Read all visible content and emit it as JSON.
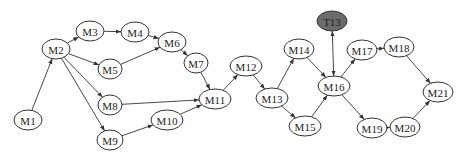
{
  "diagram": {
    "type": "directed-graph",
    "nodes": [
      {
        "id": "M1",
        "label": "M1",
        "x": 28,
        "y": 120,
        "rx": 14,
        "ry": 10,
        "style": "normal"
      },
      {
        "id": "M2",
        "label": "M2",
        "x": 56,
        "y": 49,
        "rx": 14,
        "ry": 10,
        "style": "normal"
      },
      {
        "id": "M3",
        "label": "M3",
        "x": 90,
        "y": 31,
        "rx": 14,
        "ry": 10,
        "style": "normal"
      },
      {
        "id": "M4",
        "label": "M4",
        "x": 135,
        "y": 32,
        "rx": 14,
        "ry": 10,
        "style": "normal"
      },
      {
        "id": "M5",
        "label": "M5",
        "x": 110,
        "y": 69,
        "rx": 12,
        "ry": 10,
        "style": "normal"
      },
      {
        "id": "M6",
        "label": "M6",
        "x": 172,
        "y": 42,
        "rx": 14,
        "ry": 10,
        "style": "normal"
      },
      {
        "id": "M7",
        "label": "M7",
        "x": 196,
        "y": 63,
        "rx": 12,
        "ry": 10,
        "style": "normal"
      },
      {
        "id": "M8",
        "label": "M8",
        "x": 110,
        "y": 105,
        "rx": 12,
        "ry": 10,
        "style": "normal"
      },
      {
        "id": "M9",
        "label": "M9",
        "x": 110,
        "y": 140,
        "rx": 13,
        "ry": 10,
        "style": "normal"
      },
      {
        "id": "M10",
        "label": "M10",
        "x": 167,
        "y": 120,
        "rx": 16,
        "ry": 10,
        "style": "normal"
      },
      {
        "id": "M11",
        "label": "M11",
        "x": 215,
        "y": 99,
        "rx": 16,
        "ry": 10,
        "style": "normal"
      },
      {
        "id": "M12",
        "label": "M12",
        "x": 246,
        "y": 66,
        "rx": 16,
        "ry": 10,
        "style": "normal"
      },
      {
        "id": "M13",
        "label": "M13",
        "x": 272,
        "y": 98,
        "rx": 16,
        "ry": 10,
        "style": "normal"
      },
      {
        "id": "M14",
        "label": "M14",
        "x": 299,
        "y": 49,
        "rx": 15,
        "ry": 10,
        "style": "normal"
      },
      {
        "id": "M15",
        "label": "M15",
        "x": 305,
        "y": 126,
        "rx": 16,
        "ry": 10,
        "style": "normal"
      },
      {
        "id": "M16",
        "label": "M16",
        "x": 334,
        "y": 86,
        "rx": 16,
        "ry": 10,
        "style": "normal"
      },
      {
        "id": "M17",
        "label": "M17",
        "x": 362,
        "y": 50,
        "rx": 15,
        "ry": 10,
        "style": "normal"
      },
      {
        "id": "M18",
        "label": "M18",
        "x": 399,
        "y": 47,
        "rx": 15,
        "ry": 10,
        "style": "normal"
      },
      {
        "id": "M19",
        "label": "M19",
        "x": 372,
        "y": 128,
        "rx": 15,
        "ry": 10,
        "style": "normal"
      },
      {
        "id": "M20",
        "label": "M20",
        "x": 405,
        "y": 127,
        "rx": 15,
        "ry": 10,
        "style": "normal"
      },
      {
        "id": "M21",
        "label": "M21",
        "x": 438,
        "y": 92,
        "rx": 15,
        "ry": 10,
        "style": "normal"
      },
      {
        "id": "T13",
        "label": "T13",
        "x": 332,
        "y": 21,
        "rx": 15,
        "ry": 10,
        "style": "dark"
      }
    ],
    "edges": [
      {
        "from": "M1",
        "to": "M2"
      },
      {
        "from": "M2",
        "to": "M3"
      },
      {
        "from": "M2",
        "to": "M5"
      },
      {
        "from": "M2",
        "to": "M8"
      },
      {
        "from": "M2",
        "to": "M9"
      },
      {
        "from": "M3",
        "to": "M4"
      },
      {
        "from": "M4",
        "to": "M6"
      },
      {
        "from": "M5",
        "to": "M6"
      },
      {
        "from": "M6",
        "to": "M7"
      },
      {
        "from": "M7",
        "to": "M11"
      },
      {
        "from": "M8",
        "to": "M11"
      },
      {
        "from": "M9",
        "to": "M10"
      },
      {
        "from": "M10",
        "to": "M11"
      },
      {
        "from": "M11",
        "to": "M12"
      },
      {
        "from": "M12",
        "to": "M13"
      },
      {
        "from": "M13",
        "to": "M14"
      },
      {
        "from": "M13",
        "to": "M15"
      },
      {
        "from": "M14",
        "to": "M16"
      },
      {
        "from": "M15",
        "to": "M16"
      },
      {
        "from": "M16",
        "to": "T13",
        "bidirectional": true
      },
      {
        "from": "M16",
        "to": "M17"
      },
      {
        "from": "M16",
        "to": "M19"
      },
      {
        "from": "M17",
        "to": "M18"
      },
      {
        "from": "M18",
        "to": "M21"
      },
      {
        "from": "M19",
        "to": "M20"
      },
      {
        "from": "M20",
        "to": "M21"
      }
    ],
    "colors": {
      "node_fill": "#ffffff",
      "node_stroke": "#333333",
      "highlight_fill": "#6b6b6b",
      "edge": "#333333",
      "text": "#222222"
    }
  }
}
